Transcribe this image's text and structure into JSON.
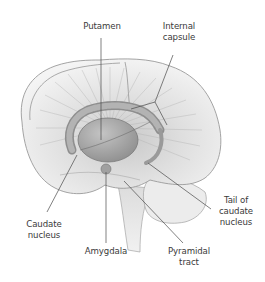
{
  "figure": {
    "labels": {
      "putamen": "Putamen",
      "internal_capsule": "Internal\ncapsule",
      "caudate_nucleus": "Caudate\nnucleus",
      "amygdala": "Amygdala",
      "pyramidal_tract": "Pyramidal\ntract",
      "tail_of_caudate": "Tail of\ncaudate\nnucleus"
    },
    "colors": {
      "background": "#ffffff",
      "brain_fill": "#ececec",
      "brain_outline": "#9a9a9a",
      "nuclei_fill": "#a9a9a9",
      "leader_line": "#4a4a4a",
      "text": "#3a3a3a"
    }
  }
}
